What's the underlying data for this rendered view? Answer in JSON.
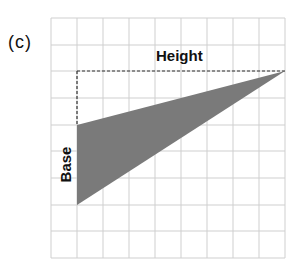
{
  "figure": {
    "panel_label": "(c)",
    "height_label": "Height",
    "base_label": "Base",
    "grid": {
      "columns": 9,
      "rows": 9,
      "line_color": "#c8c8c8"
    },
    "triangle": {
      "fill": "#7a7a7a",
      "vertices_grid": [
        [
          1,
          4
        ],
        [
          9,
          2
        ],
        [
          1,
          7
        ]
      ]
    },
    "height_guide": {
      "style": "dashed",
      "from_grid": [
        1,
        2
      ],
      "to_grid": [
        9,
        2
      ]
    },
    "colors": {
      "shape": "#7a7a7a",
      "grid": "#c8c8c8",
      "text": "#111111"
    }
  }
}
